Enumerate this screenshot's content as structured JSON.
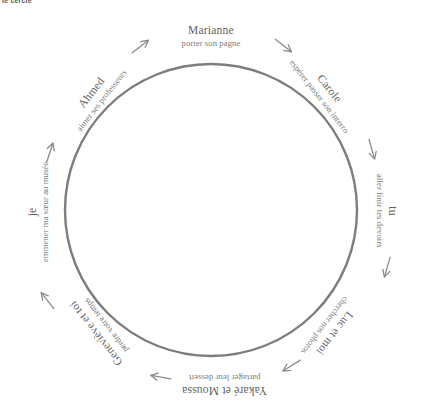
{
  "header": {
    "text": "le cercle"
  },
  "diagram": {
    "type": "circular-flow",
    "circle": {
      "center_x": 211,
      "center_y": 210,
      "radius": 146,
      "stroke_color": "#7d7d7d",
      "stroke_width": 2.4
    },
    "arrow_color": "#8a8a8a",
    "nodes": [
      {
        "id": "marianne",
        "name": "Marianne",
        "verb": "porter son pagne",
        "angle_deg": -90,
        "x": 211,
        "y": 36,
        "rotate": 0
      },
      {
        "id": "carole",
        "name": "Carole",
        "verb": "espérer passer son interro",
        "angle_deg": -45,
        "x": 325,
        "y": 92,
        "rotate": 52
      },
      {
        "id": "tu",
        "name": "tu",
        "verb": "aller finir tes devoirs",
        "angle_deg": 0,
        "x": 387,
        "y": 211,
        "rotate": 90
      },
      {
        "id": "luc-et-moi",
        "name": "Luc et moi",
        "verb": "chercher nos photos",
        "angle_deg": 45,
        "x": 330,
        "y": 330,
        "rotate": 128
      },
      {
        "id": "yakare-et-moussa",
        "name": "Yakaré et Moussa",
        "verb": "partager leur dessert",
        "angle_deg": 90,
        "x": 224,
        "y": 385,
        "rotate": 180
      },
      {
        "id": "genevieve-et-toi",
        "name": "Geneviève et toi",
        "verb": "perdre votre temps",
        "angle_deg": 135,
        "x": 100,
        "y": 330,
        "rotate": 232
      },
      {
        "id": "je",
        "name": "je",
        "verb": "emmener ma sœur au musée",
        "angle_deg": 180,
        "x": 38,
        "y": 212,
        "rotate": 270
      },
      {
        "id": "ahmed",
        "name": "Ahmed",
        "verb": "aimer ses professeurs",
        "angle_deg": -135,
        "x": 96,
        "y": 96,
        "rotate": 308
      }
    ],
    "arrows": [
      {
        "id": "arrow-ahmed-to-marianne",
        "x": 141,
        "y": 46,
        "rotate": -38
      },
      {
        "id": "arrow-marianne-to-carole",
        "x": 284,
        "y": 46,
        "rotate": 38
      },
      {
        "id": "arrow-carole-to-tu",
        "x": 372,
        "y": 150,
        "rotate": 74
      },
      {
        "id": "arrow-tu-to-luc",
        "x": 387,
        "y": 268,
        "rotate": 106
      },
      {
        "id": "arrow-luc-to-yakare",
        "x": 291,
        "y": 366,
        "rotate": 148
      },
      {
        "id": "arrow-yakare-to-genevieve",
        "x": 160,
        "y": 377,
        "rotate": 190
      },
      {
        "id": "arrow-genevieve-to-je",
        "x": 47,
        "y": 300,
        "rotate": 232
      },
      {
        "id": "arrow-je-to-ahmed",
        "x": 50,
        "y": 152,
        "rotate": 288
      }
    ]
  }
}
